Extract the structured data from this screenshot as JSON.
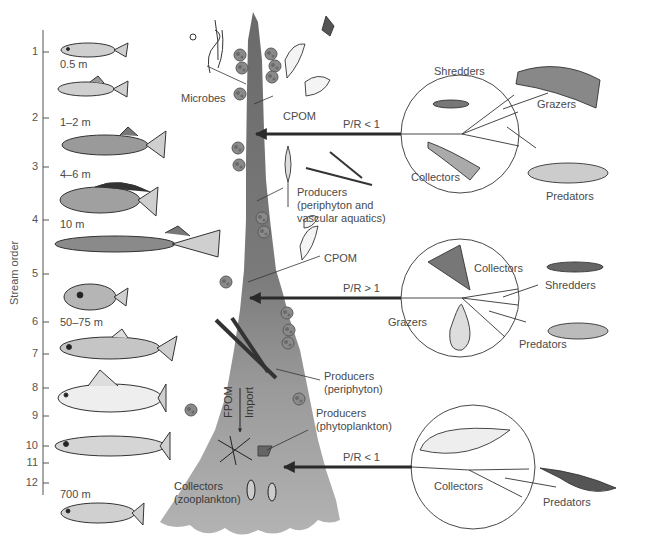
{
  "figure": {
    "axis": {
      "title": "Stream order",
      "ticks": [
        {
          "label": "1",
          "y": 52
        },
        {
          "label": "2",
          "y": 118
        },
        {
          "label": "3",
          "y": 167
        },
        {
          "label": "4",
          "y": 220
        },
        {
          "label": "5",
          "y": 274
        },
        {
          "label": "6",
          "y": 322
        },
        {
          "label": "7",
          "y": 354
        },
        {
          "label": "8",
          "y": 388
        },
        {
          "label": "9",
          "y": 416
        },
        {
          "label": "10",
          "y": 446
        },
        {
          "label": "11",
          "y": 463
        },
        {
          "label": "12",
          "y": 483
        }
      ]
    },
    "widths": [
      {
        "label": "0.5 m",
        "x": 60,
        "y": 58
      },
      {
        "label": "1–2 m",
        "x": 60,
        "y": 116
      },
      {
        "label": "4–6 m",
        "x": 60,
        "y": 168
      },
      {
        "label": "10 m",
        "x": 60,
        "y": 218
      },
      {
        "label": "50–75 m",
        "x": 60,
        "y": 316
      },
      {
        "label": "700 m",
        "x": 60,
        "y": 488
      }
    ],
    "stream_labels": {
      "microbes": "Microbes",
      "cpom_upper": "CPOM",
      "producers_upper_1": "Producers",
      "producers_upper_2": "(periphyton and",
      "producers_upper_3": "vascular aquatics)",
      "cpom_mid": "CPOM",
      "producers_mid_1": "Producers",
      "producers_mid_2": "(periphyton)",
      "fpom": "FPOM",
      "import": "Import",
      "producers_low_1": "Producers",
      "producers_low_2": "(phytoplankton)",
      "collectors_low_1": "Collectors",
      "collectors_low_2": "(zooplankton)"
    },
    "arrows": [
      {
        "ratio": "P/R < 1",
        "y": 134
      },
      {
        "ratio": "P/R > 1",
        "y": 298
      },
      {
        "ratio": "P/R < 1",
        "y": 467
      }
    ],
    "circles": [
      {
        "segment": "headwaters",
        "inner_labels": [
          "Shredders",
          "Collectors"
        ],
        "outer_labels": [
          "Grazers",
          "Predators"
        ]
      },
      {
        "segment": "mid-reaches",
        "inner_labels": [
          "Collectors",
          "Grazers"
        ],
        "outer_labels": [
          "Shredders",
          "Predators"
        ]
      },
      {
        "segment": "large rivers",
        "inner_labels": [
          "Collectors"
        ],
        "outer_labels": [
          "Predators"
        ]
      }
    ],
    "colors": {
      "stream_upper": "#6e6e6e",
      "stream_lower": "#a9a9a9",
      "arrow": "#2a2a2a",
      "text": "#4a4a4a",
      "algae": "#8a8a8a"
    }
  }
}
